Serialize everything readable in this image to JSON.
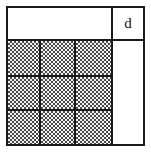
{
  "figure": {
    "title": "",
    "label_top_right": "d",
    "colors": {
      "line": "#1a1a1a",
      "background": "#ffffff",
      "stipple_dark": "#4a4a4a",
      "stipple_light": "#f2f2f2"
    },
    "grid": {
      "rows": 3,
      "columns": 3,
      "shaded": true,
      "cells": [
        [
          {
            "id": "r1c1",
            "shaded": true
          },
          {
            "id": "r1c2",
            "shaded": true
          },
          {
            "id": "r1c3",
            "shaded": true
          }
        ],
        [
          {
            "id": "r2c1",
            "shaded": true
          },
          {
            "id": "r2c2",
            "shaded": true
          },
          {
            "id": "r2c3",
            "shaded": true
          }
        ],
        [
          {
            "id": "r3c1",
            "shaded": true
          },
          {
            "id": "r3c2",
            "shaded": true
          },
          {
            "id": "r3c3",
            "shaded": true
          }
        ]
      ]
    },
    "regions": {
      "top_left": {
        "id": "top-left-panel",
        "shaded": false,
        "label": ""
      },
      "top_right": {
        "id": "label-cell",
        "shaded": false,
        "label": "d"
      },
      "right_column": {
        "id": "right-panel",
        "shaded": false,
        "label": ""
      }
    }
  }
}
